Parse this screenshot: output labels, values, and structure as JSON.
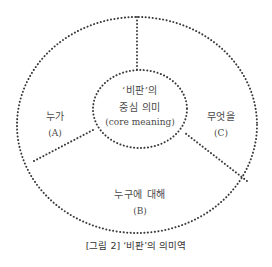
{
  "diagram": {
    "center": {
      "line1": "‘비판’의",
      "line2": "중심 의미",
      "line3": "(core meaning)"
    },
    "sections": [
      {
        "id": "A",
        "label": "누가",
        "code": "(A)"
      },
      {
        "id": "B",
        "label": "누구에 대해",
        "code": "(B)"
      },
      {
        "id": "C",
        "label": "무엇을",
        "code": "(C)"
      }
    ],
    "line_color": "#3a3a3a",
    "line_style": "dotted"
  },
  "caption": "[그림 2] ‘비판’의 의미역"
}
